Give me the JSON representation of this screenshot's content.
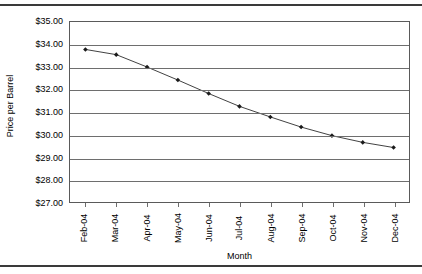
{
  "chart_data": {
    "type": "line",
    "title": "",
    "xlabel": "Month",
    "ylabel": "Price per Barrel",
    "categories": [
      "Feb-04",
      "Mar-04",
      "Apr-04",
      "May-04",
      "Jun-04",
      "Jul-04",
      "Aug-04",
      "Sep-04",
      "Oct-04",
      "Nov-04",
      "Dec-04"
    ],
    "values": [
      33.78,
      33.55,
      33.0,
      32.42,
      31.82,
      31.25,
      30.78,
      30.33,
      29.95,
      29.65,
      29.42
    ],
    "ylim": [
      27.0,
      35.0
    ],
    "ytick_step": 1.0,
    "ytick_labels": [
      "$35.00",
      "$34.00",
      "$33.00",
      "$32.00",
      "$31.00",
      "$30.00",
      "$29.00",
      "$28.00",
      "$27.00"
    ],
    "ytick_values": [
      35.0,
      34.0,
      33.0,
      32.0,
      31.0,
      30.0,
      29.0,
      28.0,
      27.0
    ],
    "grid": "horizontal",
    "legend": "none",
    "series": [
      {
        "name": "Price per Barrel",
        "values": [
          33.78,
          33.55,
          33.0,
          32.42,
          31.82,
          31.25,
          30.78,
          30.33,
          29.95,
          29.65,
          29.42
        ],
        "line_color": "#404040",
        "marker": "diamond",
        "marker_color": "#1a1a1a"
      }
    ]
  },
  "colors": {
    "line": "#404040",
    "marker": "#1a1a1a",
    "grid": "#6e6e6e",
    "axis": "#5a5a5a",
    "rule": "#3a3a3a",
    "text": "#000000",
    "background": "#ffffff"
  }
}
